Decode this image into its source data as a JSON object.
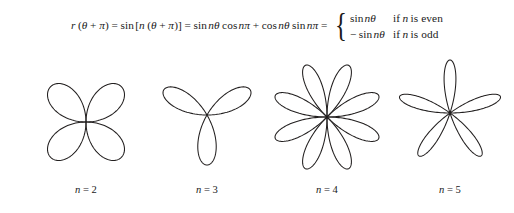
{
  "figure": {
    "background_color": "#ffffff",
    "stroke_color": "#221f1f",
    "formula": {
      "lhs": "r",
      "lhs_arg_open": "(",
      "lhs_theta": "θ",
      "lhs_plus": "+",
      "lhs_pi": "π",
      "lhs_arg_close": ")",
      "eq1": "=",
      "term1_fn": "sin",
      "term1_open": "[",
      "term1_n": "n",
      "term1_inner_open": "(",
      "term1_theta": "θ",
      "term1_plus": "+",
      "term1_pi": "π",
      "term1_inner_close": ")",
      "term1_close": "]",
      "eq2": "=",
      "term2_fn1": "sin",
      "term2_ntheta": "nθ",
      "term2_fn2": "cos",
      "term2_npi": "nπ",
      "term2_plus": "+",
      "term3_fn1": "cos",
      "term3_ntheta": "nθ",
      "term3_fn2": "sin",
      "term3_npi": "nπ",
      "eq3": "=",
      "brace": "{",
      "cases": [
        {
          "value_sign": "",
          "value_fn": "sin",
          "value_arg": "nθ",
          "condition_if": "if",
          "condition_var": "n",
          "condition_rest": "is even"
        },
        {
          "value_sign": "−",
          "value_fn": "sin",
          "value_arg": "nθ",
          "condition_if": "if",
          "condition_var": "n",
          "condition_rest": "is odd"
        }
      ]
    },
    "curves": [
      {
        "name": "rose-n2",
        "equation_n": 2,
        "petal_count": 4,
        "petal_angles_deg": [
          45,
          135,
          225,
          315
        ],
        "center_x": 86,
        "center_y": 74,
        "radius": 50,
        "cell_left": 30,
        "cell_width": 112,
        "label": "n = 2",
        "label_center_x": 86
      },
      {
        "name": "rose-n3",
        "equation_n": 3,
        "petal_count": 3,
        "petal_angles_deg": [
          30,
          150,
          270
        ],
        "center_x": 207,
        "center_y": 67,
        "radius": 50,
        "cell_left": 152,
        "cell_width": 110,
        "label": "n = 3",
        "label_center_x": 207
      },
      {
        "name": "rose-n4",
        "equation_n": 4,
        "petal_count": 8,
        "petal_angles_deg": [
          22.5,
          67.5,
          112.5,
          157.5,
          202.5,
          247.5,
          292.5,
          337.5
        ],
        "center_x": 327,
        "center_y": 69,
        "radius": 56,
        "cell_left": 268,
        "cell_width": 118,
        "label": "n = 4",
        "label_center_x": 327
      },
      {
        "name": "rose-n5",
        "equation_n": 5,
        "petal_count": 5,
        "petal_angles_deg": [
          90,
          162,
          234,
          306,
          18
        ],
        "center_x": 450,
        "center_y": 65,
        "radius": 53,
        "cell_left": 393,
        "cell_width": 114,
        "label": "n = 5",
        "label_center_x": 450
      }
    ]
  }
}
